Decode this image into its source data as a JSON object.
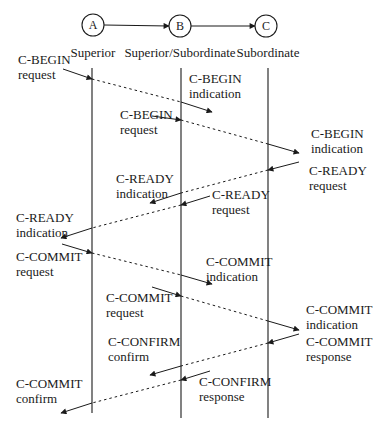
{
  "colors": {
    "ink": "#1a1a1a",
    "background": "#ffffff"
  },
  "nodes": [
    {
      "id": "A",
      "label": "A",
      "cx": 93,
      "cy": 25
    },
    {
      "id": "B",
      "label": "B",
      "cx": 180,
      "cy": 26
    },
    {
      "id": "C",
      "label": "C",
      "cx": 266,
      "cy": 26
    }
  ],
  "roles": [
    {
      "label": "Superior",
      "x": 93,
      "y": 57
    },
    {
      "label": "Superior/Subordinate",
      "x": 180,
      "y": 57
    },
    {
      "label": "Subordinate",
      "x": 268,
      "y": 57
    }
  ],
  "lifelines": [
    {
      "x": 92,
      "y1": 68,
      "y2": 413
    },
    {
      "x": 181,
      "y1": 68,
      "y2": 418
    },
    {
      "x": 268,
      "y1": 68,
      "y2": 418
    }
  ],
  "labels": [
    {
      "name": "c-begin-request-a",
      "lines": [
        "C-BEGIN",
        "request"
      ],
      "x": 18,
      "y": 64
    },
    {
      "name": "c-begin-indication-b",
      "lines": [
        "C-BEGIN",
        "indication"
      ],
      "x": 189,
      "y": 83
    },
    {
      "name": "c-begin-request-b",
      "lines": [
        "C-BEGIN",
        "request"
      ],
      "x": 120,
      "y": 119
    },
    {
      "name": "c-begin-indication-c",
      "lines": [
        "C-BEGIN",
        "indication"
      ],
      "x": 311,
      "y": 138
    },
    {
      "name": "c-ready-request-c",
      "lines": [
        "C-READY",
        "request"
      ],
      "x": 309,
      "y": 175
    },
    {
      "name": "c-ready-indication-b",
      "lines": [
        "C-READY",
        "indication"
      ],
      "x": 116,
      "y": 183
    },
    {
      "name": "c-ready-request-b",
      "lines": [
        "C-READY",
        "request"
      ],
      "x": 212,
      "y": 199
    },
    {
      "name": "c-ready-indication-a",
      "lines": [
        "C-READY",
        "indication"
      ],
      "x": 16,
      "y": 222
    },
    {
      "name": "c-commit-request-a",
      "lines": [
        "C-COMMIT",
        "request"
      ],
      "x": 16,
      "y": 261
    },
    {
      "name": "c-commit-indication-b",
      "lines": [
        "C-COMMIT",
        "indication"
      ],
      "x": 206,
      "y": 266
    },
    {
      "name": "c-commit-request-b",
      "lines": [
        "C-COMMIT",
        "request"
      ],
      "x": 106,
      "y": 302
    },
    {
      "name": "c-commit-indication-c",
      "lines": [
        "C-COMMIT",
        "indication"
      ],
      "x": 306,
      "y": 314
    },
    {
      "name": "c-confirm-confirm-b",
      "lines": [
        "C-CONFIRM",
        "confirm"
      ],
      "x": 108,
      "y": 346
    },
    {
      "name": "c-commit-response-c",
      "lines": [
        "C-COMMIT",
        "response"
      ],
      "x": 306,
      "y": 346
    },
    {
      "name": "c-commit-confirm-a",
      "lines": [
        "C-COMMIT",
        "confirm"
      ],
      "x": 16,
      "y": 388
    },
    {
      "name": "c-confirm-response-b",
      "lines": [
        "C-CONFIRM",
        "response"
      ],
      "x": 199,
      "y": 386
    }
  ],
  "messages": [
    {
      "name": "c-begin-a-to-b",
      "segments": [
        [
          63,
          69,
          92,
          79,
          "solid"
        ],
        [
          92,
          79,
          181,
          102,
          "dashed"
        ],
        [
          181,
          102,
          212,
          112,
          "arrow"
        ]
      ]
    },
    {
      "name": "c-begin-b-to-c",
      "segments": [
        [
          152,
          116,
          181,
          120,
          "solid"
        ],
        [
          181,
          120,
          268,
          144,
          "dashed"
        ],
        [
          268,
          144,
          299,
          153,
          "arrow"
        ]
      ]
    },
    {
      "name": "c-ready-c-to-b",
      "segments": [
        [
          299,
          162,
          268,
          170,
          "solid"
        ],
        [
          268,
          170,
          181,
          193,
          "dashed"
        ],
        [
          181,
          193,
          150,
          203,
          "arrow"
        ]
      ]
    },
    {
      "name": "c-ready-b-to-a",
      "segments": [
        [
          210,
          196,
          181,
          205,
          "solid"
        ],
        [
          181,
          205,
          92,
          228,
          "dashed"
        ],
        [
          92,
          228,
          61,
          238,
          "arrow"
        ]
      ]
    },
    {
      "name": "c-commit-a-to-b",
      "segments": [
        [
          62,
          244,
          92,
          253,
          "solid"
        ],
        [
          92,
          253,
          181,
          275,
          "dashed"
        ],
        [
          181,
          275,
          212,
          284,
          "arrow"
        ]
      ]
    },
    {
      "name": "c-commit-b-to-c",
      "segments": [
        [
          152,
          287,
          181,
          296,
          "solid"
        ],
        [
          181,
          296,
          268,
          321,
          "dashed"
        ],
        [
          268,
          321,
          299,
          330,
          "arrow"
        ]
      ]
    },
    {
      "name": "c-commit-response-c-to-b",
      "segments": [
        [
          299,
          334,
          268,
          343,
          "solid"
        ],
        [
          268,
          343,
          181,
          366,
          "dashed"
        ],
        [
          181,
          366,
          150,
          375,
          "arrow"
        ]
      ]
    },
    {
      "name": "c-confirm-b-to-a",
      "segments": [
        [
          210,
          371,
          181,
          380,
          "solid"
        ],
        [
          181,
          380,
          92,
          403,
          "dashed"
        ],
        [
          92,
          403,
          61,
          413,
          "arrow"
        ]
      ]
    }
  ],
  "top_arrows": [
    {
      "name": "arrow-a-to-b",
      "x1": 104,
      "y1": 25,
      "x2": 169,
      "y2": 26
    },
    {
      "name": "arrow-b-to-c",
      "x1": 191,
      "y1": 26,
      "x2": 255,
      "y2": 26
    }
  ]
}
